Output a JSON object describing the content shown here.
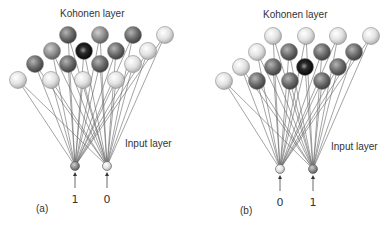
{
  "colors": {
    "light": "#d8d8d8",
    "mid": "#8a8a8a",
    "dark": "#5c5c5c",
    "winner": "#151515",
    "wire": "#666666",
    "text": "#333333"
  },
  "panels": [
    {
      "id": "a",
      "caption": "(a)",
      "caption_pos": [
        36,
        212
      ],
      "kohonen_label": "Kohonen layer",
      "kohonen_label_pos": [
        60,
        17
      ],
      "input_label": "Input layer",
      "input_label_pos": [
        125,
        147
      ],
      "inputs": [
        {
          "x": 75,
          "y": 166,
          "value": "1",
          "shade": "mid"
        },
        {
          "x": 107,
          "y": 166,
          "value": "0",
          "shade": "light"
        }
      ],
      "nodes": [
        {
          "x": 68,
          "y": 35,
          "shade": "dark"
        },
        {
          "x": 100,
          "y": 35,
          "shade": "mid"
        },
        {
          "x": 133,
          "y": 35,
          "shade": "dark"
        },
        {
          "x": 165,
          "y": 35,
          "shade": "light"
        },
        {
          "x": 52,
          "y": 51,
          "shade": "mid"
        },
        {
          "x": 84,
          "y": 51,
          "shade": "winner"
        },
        {
          "x": 116,
          "y": 51,
          "shade": "dark"
        },
        {
          "x": 148,
          "y": 51,
          "shade": "light"
        },
        {
          "x": 35,
          "y": 64,
          "shade": "dark"
        },
        {
          "x": 68,
          "y": 64,
          "shade": "dark"
        },
        {
          "x": 100,
          "y": 64,
          "shade": "dark"
        },
        {
          "x": 133,
          "y": 64,
          "shade": "light"
        },
        {
          "x": 18,
          "y": 80,
          "shade": "light"
        },
        {
          "x": 51,
          "y": 80,
          "shade": "light"
        },
        {
          "x": 83,
          "y": 80,
          "shade": "light"
        },
        {
          "x": 116,
          "y": 80,
          "shade": "light"
        }
      ]
    },
    {
      "id": "b",
      "caption": "(b)",
      "caption_pos": [
        240,
        214
      ],
      "kohonen_label": "Kohonen layer",
      "kohonen_label_pos": [
        263,
        18
      ],
      "input_label": "Input layer",
      "input_label_pos": [
        331,
        150
      ],
      "inputs": [
        {
          "x": 280,
          "y": 169,
          "value": "0",
          "shade": "light"
        },
        {
          "x": 313,
          "y": 169,
          "value": "1",
          "shade": "mid"
        }
      ],
      "nodes": [
        {
          "x": 273,
          "y": 36,
          "shade": "light"
        },
        {
          "x": 306,
          "y": 36,
          "shade": "light"
        },
        {
          "x": 338,
          "y": 36,
          "shade": "light"
        },
        {
          "x": 371,
          "y": 36,
          "shade": "light"
        },
        {
          "x": 257,
          "y": 52,
          "shade": "light"
        },
        {
          "x": 289,
          "y": 52,
          "shade": "dark"
        },
        {
          "x": 322,
          "y": 52,
          "shade": "dark"
        },
        {
          "x": 354,
          "y": 52,
          "shade": "dark"
        },
        {
          "x": 241,
          "y": 67,
          "shade": "light"
        },
        {
          "x": 273,
          "y": 67,
          "shade": "dark"
        },
        {
          "x": 305,
          "y": 67,
          "shade": "winner"
        },
        {
          "x": 338,
          "y": 67,
          "shade": "dark"
        },
        {
          "x": 224,
          "y": 81,
          "shade": "light"
        },
        {
          "x": 257,
          "y": 81,
          "shade": "dark"
        },
        {
          "x": 290,
          "y": 81,
          "shade": "dark"
        },
        {
          "x": 322,
          "y": 81,
          "shade": "dark"
        }
      ]
    }
  ]
}
